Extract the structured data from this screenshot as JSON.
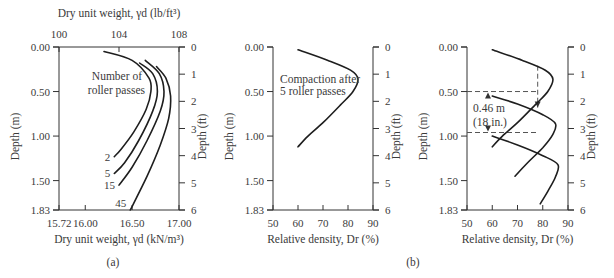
{
  "figure": {
    "caption_a": "(a)",
    "caption_b": "(b)"
  },
  "chart_data": [
    {
      "type": "line",
      "panel": "(a)",
      "title": "",
      "xlabel": "Dry unit weight, γd (kN/m³)",
      "xlabel_top": "Dry unit weight, γd (lb/ft³)",
      "ylabel": "Depth (m)",
      "ylabel_right": "Depth (ft)",
      "xlim": [
        15.72,
        17.0
      ],
      "xticks": [
        "15.72",
        "16.00",
        "16.50",
        "17.00"
      ],
      "xticks_top": [
        "100",
        "104",
        "108"
      ],
      "ylim": [
        0,
        1.83
      ],
      "yticks": [
        "0.00",
        "0.50",
        "1.00",
        "1.50",
        "1.83"
      ],
      "yticks_right": [
        "0",
        "1",
        "2",
        "3",
        "4",
        "5",
        "6"
      ],
      "annotation": [
        "Number of",
        "roller passes"
      ],
      "series": [
        {
          "name": "2",
          "points": [
            [
              16.2,
              0.05
            ],
            [
              16.5,
              0.15
            ],
            [
              16.68,
              0.35
            ],
            [
              16.7,
              0.5
            ],
            [
              16.65,
              0.7
            ],
            [
              16.52,
              0.95
            ],
            [
              16.38,
              1.15
            ],
            [
              16.31,
              1.23
            ]
          ]
        },
        {
          "name": "5",
          "points": [
            [
              16.58,
              0.18
            ],
            [
              16.72,
              0.3
            ],
            [
              16.77,
              0.5
            ],
            [
              16.72,
              0.72
            ],
            [
              16.57,
              1.05
            ],
            [
              16.42,
              1.3
            ],
            [
              16.31,
              1.42
            ]
          ]
        },
        {
          "name": "15",
          "points": [
            [
              16.64,
              0.15
            ],
            [
              16.79,
              0.3
            ],
            [
              16.84,
              0.5
            ],
            [
              16.8,
              0.72
            ],
            [
              16.66,
              1.05
            ],
            [
              16.5,
              1.35
            ],
            [
              16.36,
              1.55
            ]
          ]
        },
        {
          "name": "45",
          "points": [
            [
              16.76,
              0.22
            ],
            [
              16.86,
              0.35
            ],
            [
              16.91,
              0.55
            ],
            [
              16.89,
              0.8
            ],
            [
              16.8,
              1.1
            ],
            [
              16.66,
              1.45
            ],
            [
              16.48,
              1.83
            ]
          ]
        }
      ]
    },
    {
      "type": "line",
      "panel": "(b) left",
      "title": "",
      "xlabel": "Relative density, Dr (%)",
      "ylabel": "Depth (m)",
      "ylabel_right": "Depth (ft)",
      "xlim": [
        50,
        90
      ],
      "xticks": [
        "50",
        "60",
        "70",
        "80",
        "90"
      ],
      "ylim": [
        0,
        1.83
      ],
      "yticks": [
        "0.00",
        "0.50",
        "1.00",
        "1.50",
        "1.83"
      ],
      "yticks_right": [
        "0",
        "1",
        "2",
        "3",
        "4",
        "5",
        "6"
      ],
      "annotation": [
        "Compaction after",
        "5 roller passes"
      ],
      "series": [
        {
          "name": "Compaction after 5 roller passes",
          "points": [
            [
              60,
              0.03
            ],
            [
              72,
              0.15
            ],
            [
              81,
              0.26
            ],
            [
              84,
              0.36
            ],
            [
              82,
              0.5
            ],
            [
              77,
              0.65
            ],
            [
              70,
              0.85
            ],
            [
              64,
              1.0
            ],
            [
              60,
              1.12
            ]
          ]
        }
      ]
    },
    {
      "type": "line",
      "panel": "(b) right",
      "title": "",
      "xlabel": "Relative density, Dr (%)",
      "ylabel": "Depth (m)",
      "ylabel_right": "Depth (ft)",
      "xlim": [
        50,
        90
      ],
      "xticks": [
        "50",
        "60",
        "70",
        "80",
        "90"
      ],
      "ylim": [
        0,
        1.83
      ],
      "yticks": [
        "0.00",
        "0.50",
        "1.00",
        "1.50",
        "1.83"
      ],
      "yticks_right": [
        "0",
        "1",
        "2",
        "3",
        "4",
        "5",
        "6"
      ],
      "annotation": [
        "0.46 m",
        "(18 in.)"
      ],
      "series": [
        {
          "name": "Lift 1",
          "points": [
            [
              60,
              0.03
            ],
            [
              72,
              0.15
            ],
            [
              81,
              0.26
            ],
            [
              84,
              0.36
            ],
            [
              82,
              0.5
            ],
            [
              77,
              0.65
            ],
            [
              70,
              0.85
            ],
            [
              64,
              1.0
            ],
            [
              60,
              1.12
            ]
          ]
        },
        {
          "name": "Lift 2",
          "points": [
            [
              60,
              0.55
            ],
            [
              70,
              0.64
            ],
            [
              80,
              0.76
            ],
            [
              85,
              0.86
            ],
            [
              84,
              0.98
            ],
            [
              80,
              1.13
            ],
            [
              74,
              1.3
            ],
            [
              69,
              1.45
            ]
          ]
        },
        {
          "name": "Lift 3",
          "points": [
            [
              60,
              1.0
            ],
            [
              70,
              1.1
            ],
            [
              80,
              1.22
            ],
            [
              86,
              1.32
            ],
            [
              85,
              1.46
            ],
            [
              82,
              1.62
            ],
            [
              79,
              1.76
            ]
          ]
        }
      ],
      "reference_lines": {
        "dashed_horizontal_m": [
          0.5,
          0.96
        ],
        "dashed_vertical_percent": 78,
        "dimension": "0.46 m (18 in.)"
      }
    }
  ]
}
